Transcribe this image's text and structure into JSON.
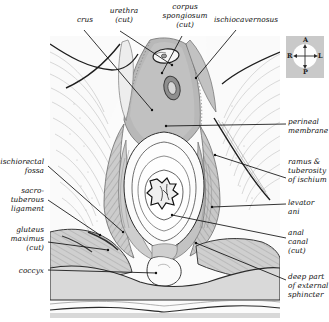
{
  "figure": {
    "kind": "anatomical-illustration",
    "background_color": "#ffffff",
    "ink_color": "#111111",
    "tissue_light": "#f0f0f0",
    "tissue_mid": "#d2d2d2",
    "tissue_dark": "#b4b4b4",
    "tissue_deep": "#9a9a9a"
  },
  "compass": {
    "name": "orientation-compass",
    "background": "#c9c9c9",
    "disc": "#fdfdfd",
    "anterior": "A",
    "posterior": "P",
    "right": "R",
    "left": "L"
  },
  "labels": {
    "top": [
      {
        "id": "crus",
        "text": "crus",
        "x": 68,
        "y": 15,
        "w": 34,
        "align": "center"
      },
      {
        "id": "urethra-cut",
        "text": "urethra\n(cut)",
        "x": 102,
        "y": 6,
        "w": 44,
        "align": "center"
      },
      {
        "id": "corpus-spongiosum-cut",
        "text": "corpus\nspongiosum\n(cut)",
        "x": 155,
        "y": 2,
        "w": 60,
        "align": "center"
      },
      {
        "id": "ischiocavernosus",
        "text": "ischiocavernosus",
        "x": 214,
        "y": 15,
        "w": 62,
        "align": "center"
      }
    ],
    "left": [
      {
        "id": "ischiorectal-fossa",
        "text": "ischiorectal\nfossa",
        "x": 0,
        "y": 157,
        "w": 44,
        "align": "right"
      },
      {
        "id": "sacrotuberous-ligament",
        "text": "sacro-\ntuberous\nligament",
        "x": 0,
        "y": 186,
        "w": 44,
        "align": "right"
      },
      {
        "id": "gluteus-maximus-cut",
        "text": "gluteus\nmaximus\n(cut)",
        "x": 0,
        "y": 225,
        "w": 44,
        "align": "right"
      },
      {
        "id": "coccyx",
        "text": "coccyx",
        "x": 0,
        "y": 266,
        "w": 44,
        "align": "right"
      }
    ],
    "right": [
      {
        "id": "perineal-membrane",
        "text": "perineal\nmembrane",
        "x": 288,
        "y": 117,
        "w": 42,
        "align": "left"
      },
      {
        "id": "ramus-tuberosity-ischium",
        "text": "ramus &\ntuberosity\nof ischium",
        "x": 288,
        "y": 157,
        "w": 42,
        "align": "left"
      },
      {
        "id": "levator-ani",
        "text": "levator\nani",
        "x": 288,
        "y": 198,
        "w": 42,
        "align": "left"
      },
      {
        "id": "anal-canal-cut",
        "text": "anal\ncanal\n(cut)",
        "x": 288,
        "y": 228,
        "w": 42,
        "align": "left"
      },
      {
        "id": "deep-part-external-sphincter",
        "text": "deep part\nof external\nsphincter",
        "x": 288,
        "y": 272,
        "w": 42,
        "align": "left"
      }
    ]
  },
  "leader_lines": [
    {
      "id": "leader-crus",
      "x1": 84,
      "y1": 30,
      "x2": 152,
      "y2": 110
    },
    {
      "id": "leader-urethra",
      "x1": 120,
      "y1": 31,
      "x2": 172,
      "y2": 65
    },
    {
      "id": "leader-corpus-spongiosum",
      "x1": 182,
      "y1": 36,
      "x2": 162,
      "y2": 73
    },
    {
      "id": "leader-ischiocavernosus",
      "x1": 236,
      "y1": 30,
      "x2": 196,
      "y2": 78
    },
    {
      "id": "leader-ischiorectal-fossa",
      "x1": 48,
      "y1": 166,
      "x2": 123,
      "y2": 232
    },
    {
      "id": "leader-sacrotuberous",
      "x1": 48,
      "y1": 200,
      "x2": 100,
      "y2": 235
    },
    {
      "id": "leader-gluteus-maximus",
      "x1": 48,
      "y1": 242,
      "x2": 108,
      "y2": 250
    },
    {
      "id": "leader-coccyx",
      "x1": 48,
      "y1": 270,
      "x2": 156,
      "y2": 273
    },
    {
      "id": "leader-perineal-membrane",
      "x1": 286,
      "y1": 124,
      "x2": 166,
      "y2": 126
    },
    {
      "id": "leader-ramus-tuberosity",
      "x1": 286,
      "y1": 178,
      "x2": 215,
      "y2": 155
    },
    {
      "id": "leader-levator-ani",
      "x1": 286,
      "y1": 204,
      "x2": 212,
      "y2": 207
    },
    {
      "id": "leader-anal-canal",
      "x1": 286,
      "y1": 238,
      "x2": 172,
      "y2": 215
    },
    {
      "id": "leader-deep-sphincter",
      "x1": 286,
      "y1": 280,
      "x2": 196,
      "y2": 243
    }
  ],
  "structures": [
    {
      "id": "urethra-opening",
      "name": "urethra-cut-oval"
    },
    {
      "id": "corpus-spongiosum",
      "name": "corpus-spongiosum-cut-oval"
    },
    {
      "id": "perineal-membrane",
      "name": "perineal-membrane-region"
    },
    {
      "id": "ischiorectal-fossa-left",
      "name": "ischiorectal-fossa-left"
    },
    {
      "id": "ischiorectal-fossa-right",
      "name": "ischiorectal-fossa-right"
    },
    {
      "id": "levator-ani",
      "name": "levator-ani-sheet"
    },
    {
      "id": "anal-canal",
      "name": "anal-canal-cut-lumen"
    },
    {
      "id": "external-sphincter",
      "name": "external-anal-sphincter-rings"
    },
    {
      "id": "coccyx",
      "name": "coccyx-bone"
    },
    {
      "id": "gluteus-maximus",
      "name": "gluteus-maximus-cut"
    }
  ]
}
